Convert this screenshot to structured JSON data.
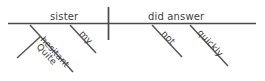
{
  "diagram": {
    "type": "reed-kellogg-sentence-diagram",
    "sentence": "Quite hesitant, my sister did not answer quickly",
    "background_color": "#ffffff",
    "line_color": "#4a4a4a",
    "text_color": "#3d3d3d",
    "baseline": {
      "subject": {
        "label": "sister",
        "role": "subject"
      },
      "predicate": {
        "label": "did answer",
        "role": "verb"
      },
      "divider": {
        "label": "",
        "role": "subject-predicate-divider"
      }
    },
    "modifiers": [
      {
        "label": "hesitant",
        "attaches_to": "sister",
        "role": "adjective"
      },
      {
        "label": "Quite",
        "attaches_to": "hesitant",
        "role": "adverb"
      },
      {
        "label": "my",
        "attaches_to": "sister",
        "role": "possessive-adjective"
      },
      {
        "label": "not",
        "attaches_to": "did answer",
        "role": "adverb"
      },
      {
        "label": "quickly",
        "attaches_to": "did answer",
        "role": "adverb"
      }
    ]
  }
}
